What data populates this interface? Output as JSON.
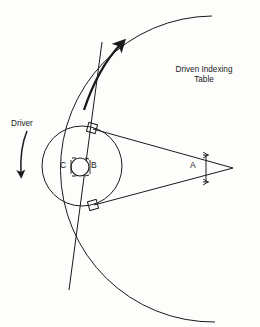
{
  "figure": {
    "type": "mechanical-diagram",
    "background_color": "#fdfdfc",
    "line_color": "#1a1a1a",
    "width": 260,
    "height": 327
  },
  "labels": {
    "driven_table": "Driven Indexing\nTable",
    "driven_table_line1": "Driven Indexing",
    "driven_table_line2": "Table",
    "driver": "Driver",
    "center_c": "C",
    "center_b": "B",
    "angle_a": "A"
  },
  "geometry": {
    "driver_circle": {
      "cx": 82,
      "cy": 166,
      "r": 40
    },
    "hub_circle": {
      "cx": 80,
      "cy": 167,
      "r": 9
    },
    "apex": {
      "x": 233,
      "y": 168
    },
    "tangent_point_upper": {
      "x": 93,
      "y": 129
    },
    "tangent_point_lower": {
      "x": 94,
      "y": 205
    },
    "table_arc": {
      "cx": 233,
      "cy": 168,
      "r": 152
    },
    "right_angle_markers": 2,
    "angle_a_degrees": 15
  },
  "annotations": {
    "driven_rotation_direction": "counterclockwise-up",
    "driver_rotation_direction": "clockwise-down",
    "angle_dimension": "A"
  }
}
